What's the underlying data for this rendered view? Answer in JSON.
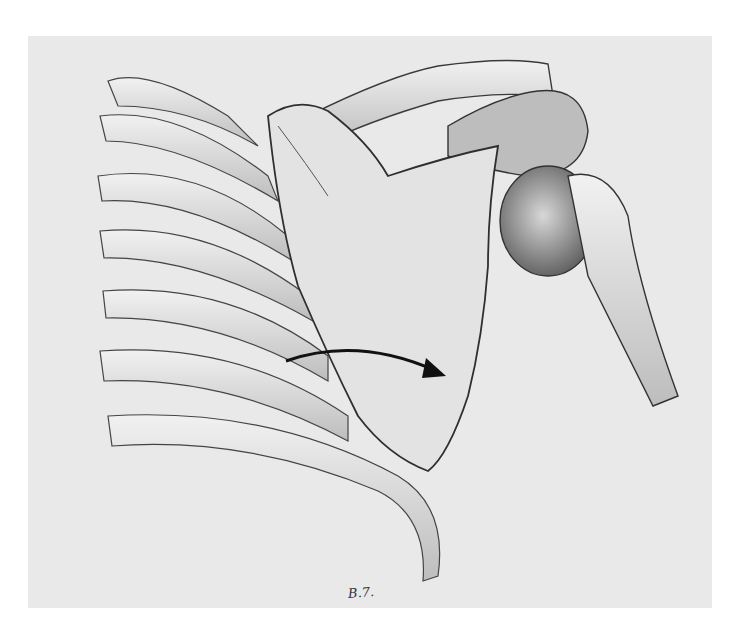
{
  "illustration": {
    "subject": "Anatomical drawing of right shoulder girdle: scapula, clavicle, humeral head and ribs, with curved arrow indicating scapular motion over the rib cage",
    "background_color": "#e9e9e9",
    "ink_color": "#2a2a2a",
    "signature": "B.7."
  }
}
